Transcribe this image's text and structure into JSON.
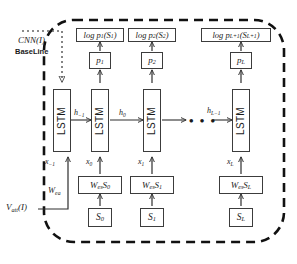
{
  "diagram": {
    "type": "neural-network-unrolled-rnn",
    "outer_boundary": {
      "style": "dashed-rounded-rectangle",
      "color": "#111111"
    },
    "inputs": {
      "cnn_label": "CNN(I)",
      "cnn_sublabel": "BaseLine",
      "cnn_arrow_style": "dotted",
      "vatt_label": "Vₐₜₜ(I)",
      "vatt_text": "V",
      "vatt_sub": "att",
      "vatt_paren": "(I)",
      "wea_label": "W",
      "wea_sub": "ea"
    },
    "columns": [
      {
        "id": "col-init",
        "lstm_label": "LSTM",
        "log_label": null,
        "p_label": null,
        "x_label": "x",
        "x_sub": "−1",
        "wes_label": null,
        "s_label": null,
        "h_out_label": "h",
        "h_out_sub": "−1"
      },
      {
        "id": "col-0",
        "lstm_label": "LSTM",
        "log_label": "log p",
        "log_sub1": "1",
        "log_arg": "(S",
        "log_sub2": "1",
        "log_close": ")",
        "p_label": "p",
        "p_sub": "1",
        "x_label": "x",
        "x_sub": "0",
        "wes_label": "W",
        "wes_sub": "es",
        "wes_s": "S",
        "wes_s_sub": "0",
        "s_label": "S",
        "s_sub": "0",
        "h_out_label": "h",
        "h_out_sub": "0"
      },
      {
        "id": "col-1",
        "lstm_label": "LSTM",
        "log_label": "log p",
        "log_sub1": "2",
        "log_arg": "(S",
        "log_sub2": "2",
        "log_close": ")",
        "p_label": "p",
        "p_sub": "2",
        "x_label": "x",
        "x_sub": "1",
        "wes_label": "W",
        "wes_sub": "es",
        "wes_s": "S",
        "wes_s_sub": "1",
        "s_label": "S",
        "s_sub": "1",
        "h_out_label": null,
        "h_out_sub": null
      },
      {
        "id": "col-L",
        "lstm_label": "LSTM",
        "log_label": "log p",
        "log_sub1": "L+1",
        "log_arg": "(S",
        "log_sub2": "L+1",
        "log_close": ")",
        "p_label": "p",
        "p_sub": "L",
        "x_label": "x",
        "x_sub": "L",
        "wes_label": "W",
        "wes_sub": "es",
        "wes_s": "S",
        "wes_s_sub": "L",
        "s_label": "S",
        "s_sub": "L",
        "h_in_label": "h",
        "h_in_sub": "L−1"
      }
    ],
    "ellipsis": "• • •"
  }
}
